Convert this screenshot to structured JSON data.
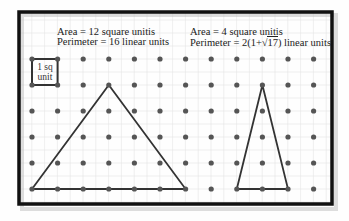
{
  "figure": {
    "left_shape": {
      "area_label": "Area = 12 square unitis",
      "perimeter_label": "Perimeter = 16 linear units"
    },
    "right_shape": {
      "area_label": "Area = 4 square unitis",
      "perimeter_prefix": "Perimeter = 2(1+",
      "perimeter_radicand": "17",
      "perimeter_suffix": ") linear units"
    },
    "unit_square": {
      "line1": "1 sq",
      "line2": "unit"
    },
    "grid": {
      "columns": 12,
      "rows": 6,
      "origin_x": 32,
      "origin_y": 59,
      "spacing_x": 25.6,
      "spacing_y": 26
    },
    "colors": {
      "frame": "#111111",
      "dot": "#555555",
      "line": "#333333",
      "grid": "#e4e4e4"
    }
  }
}
